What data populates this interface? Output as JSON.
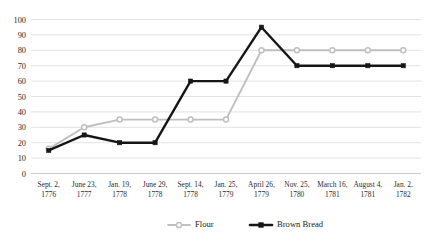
{
  "chart_data": {
    "type": "line",
    "title": "",
    "xlabel": "",
    "ylabel": "",
    "ylim": [
      0,
      100
    ],
    "ytick_step": 10,
    "grid": true,
    "legend_position": "bottom",
    "categories": [
      "Sept. 2,\n1776",
      "June 23,\n1777",
      "Jan. 19,\n1778",
      "June 29,\n1778",
      "Sept. 14,\n1778",
      "Jan. 25,\n1779",
      "April 26,\n1779",
      "Nov. 25,\n1780",
      "March 16,\n1781",
      "August 4,\n1781",
      "Jan. 2,\n1782"
    ],
    "categories_lines": [
      [
        "Sept. 2,",
        "1776"
      ],
      [
        "June 23,",
        "1777"
      ],
      [
        "Jan. 19,",
        "1778"
      ],
      [
        "June 29,",
        "1778"
      ],
      [
        "Sept. 14,",
        "1778"
      ],
      [
        "Jan. 25,",
        "1779"
      ],
      [
        "April 26,",
        "1779"
      ],
      [
        "Nov. 25,",
        "1780"
      ],
      [
        "March 16,",
        "1781"
      ],
      [
        "August 4,",
        "1781"
      ],
      [
        "Jan. 2,",
        "1782"
      ]
    ],
    "ytick_labels": [
      "0",
      "10",
      "20",
      "30",
      "40",
      "50",
      "60",
      "70",
      "80",
      "90",
      "100"
    ],
    "ytick_values": [
      0,
      10,
      20,
      30,
      40,
      50,
      60,
      70,
      80,
      90,
      100
    ],
    "series": [
      {
        "name": "Flour",
        "color": "#bfbfbf",
        "marker": "open-circle",
        "values": [
          16,
          30,
          35,
          35,
          35,
          35,
          80,
          80,
          80,
          80,
          80
        ]
      },
      {
        "name": "Brown Bread",
        "color": "#161616",
        "marker": "filled-square",
        "values": [
          15,
          25,
          20,
          20,
          60,
          60,
          95,
          70,
          70,
          70,
          70
        ]
      }
    ]
  },
  "legend": {
    "items": [
      {
        "label": "Flour",
        "color": "#bfbfbf",
        "marker": "open-circle"
      },
      {
        "label": "Brown Bread",
        "color": "#161616",
        "marker": "filled-square"
      }
    ]
  }
}
